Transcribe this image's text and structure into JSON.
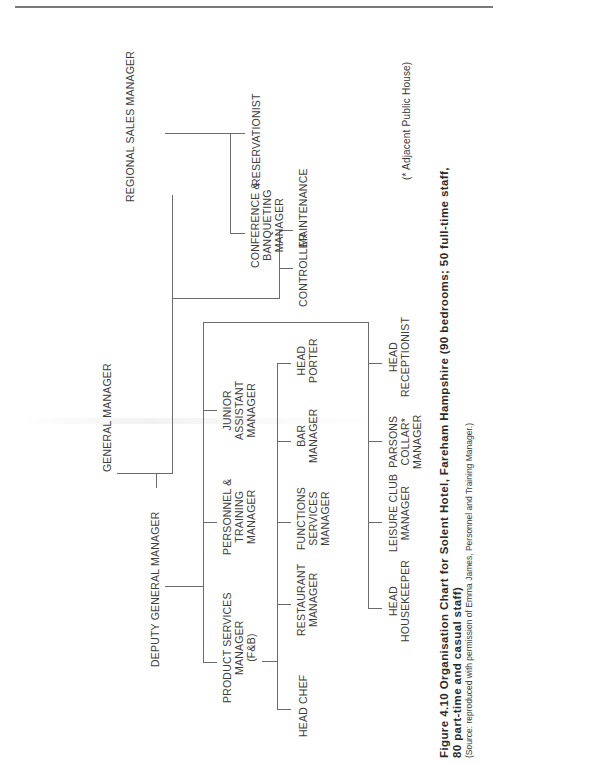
{
  "page": {
    "orientation": "rotated-90-ccw",
    "line_color": "#6b6b6b",
    "text_color": "#3c3c3c"
  },
  "chart": {
    "general_manager": "GENERAL MANAGER",
    "deputy_general_manager": "DEPUTY GENERAL MANAGER",
    "regional_sales_manager": "REGIONAL SALES MANAGER",
    "conference": [
      "CONFERENCE &",
      "BANQUETING",
      "MANAGER"
    ],
    "reservationist": "RESERVATIONIST",
    "controller": "CONTROLLER",
    "maintenance": "MAINTENANCE",
    "product_services": [
      "PRODUCT SERVICES",
      "MANAGER",
      "(F&B)"
    ],
    "personnel": [
      "PERSONNEL &",
      "TRAINING",
      "MANAGER"
    ],
    "junior_assistant": [
      "JUNIOR",
      "ASSISTANT",
      "MANAGER"
    ],
    "head_chef": "HEAD CHEF",
    "restaurant": [
      "RESTAURANT",
      "MANAGER"
    ],
    "functions": [
      "FUNCTIONS",
      "SERVICES",
      "MANAGER"
    ],
    "bar": [
      "BAR",
      "MANAGER"
    ],
    "head_porter": [
      "HEAD",
      "PORTER"
    ],
    "head_housekeeper": [
      "HEAD",
      "HOUSEKEEPER"
    ],
    "leisure_club": [
      "LEISURE CLUB",
      "MANAGER"
    ],
    "parsons_collar": [
      "PARSONS",
      "COLLAR*",
      "MANAGER"
    ],
    "head_receptionist": [
      "HEAD",
      "RECEPTIONIST"
    ],
    "footnote": "(* Adjacent Public House)"
  },
  "caption": {
    "line1": "Figure 4.10  Organisation Chart for Solent Hotel, Fareham Hampshire (90 bedrooms; 50 full-time staff,",
    "line2": "80 part-time and casual staff)",
    "source": "(Source: reproduced with permission of Emma James, Personnel and Training Manager.)"
  }
}
